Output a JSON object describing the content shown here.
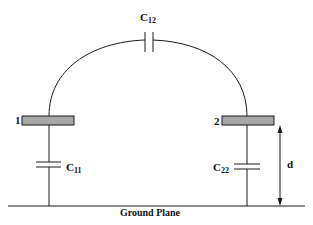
{
  "diagram": {
    "conductors": [
      {
        "id": "1",
        "label": "1"
      },
      {
        "id": "2",
        "label": "2"
      }
    ],
    "capacitors": {
      "c12": {
        "main": "C",
        "sub": "12"
      },
      "c11": {
        "main": "C",
        "sub": "11"
      },
      "c22": {
        "main": "C",
        "sub": "22"
      }
    },
    "dimension_label": "d",
    "ground_label": "Ground Plane",
    "colors": {
      "line": "#1a1a1a",
      "plate_fill": "#a6a6a6",
      "background": "#ffffff"
    }
  }
}
